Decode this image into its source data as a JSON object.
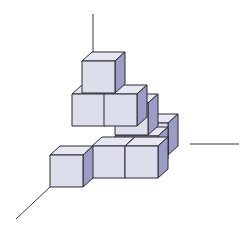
{
  "diagram": {
    "title": "",
    "colors": {
      "front_face": "#dcdeec",
      "top_face": "#e6e7f1",
      "side_face": "#9c9dc4",
      "edge": "#2b2b33",
      "axis": "#3a3a3a",
      "background": "#ffffff"
    },
    "axes": [
      {
        "name": "vertical-axis",
        "x1": 93,
        "y1": 14,
        "x2": 93,
        "y2": 52
      },
      {
        "name": "right-axis",
        "x1": 190,
        "y1": 144,
        "x2": 239,
        "y2": 144
      },
      {
        "name": "left-axis",
        "x1": 16,
        "y1": 219,
        "x2": 50,
        "y2": 187
      }
    ],
    "cube_count": 10,
    "layers": [
      {
        "level": 1,
        "cubes": 6
      },
      {
        "level": 2,
        "cubes": 3
      },
      {
        "level": 3,
        "cubes": 1
      }
    ]
  }
}
